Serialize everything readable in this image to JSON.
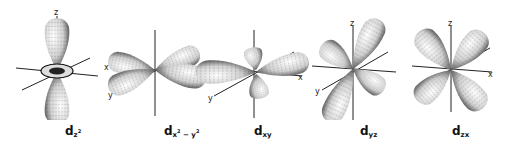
{
  "figure": {
    "orbitals": [
      {
        "id": "dz2",
        "label_main": "d",
        "label_sub": "z",
        "label_sup": "2",
        "axes": [
          "z",
          "x"
        ]
      },
      {
        "id": "dx2-y2",
        "label_main": "d",
        "label_sub": "x",
        "label_sup": "2",
        "label_sub2": " − y",
        "label_sup2": "2",
        "axes": [
          "x",
          "y"
        ]
      },
      {
        "id": "dxy",
        "label_main": "d",
        "label_sub": "xy",
        "axes": [
          "x",
          "y"
        ]
      },
      {
        "id": "dyz",
        "label_main": "d",
        "label_sub": "yz",
        "axes": [
          "z",
          "y"
        ]
      },
      {
        "id": "dzx",
        "label_main": "d",
        "label_sub": "zx",
        "axes": [
          "z",
          "x"
        ]
      }
    ]
  },
  "colors": {
    "background": "#ffffff",
    "lobe_fill": "#e6e6e6",
    "lobe_shade": "#222222",
    "axis": "#222222"
  }
}
